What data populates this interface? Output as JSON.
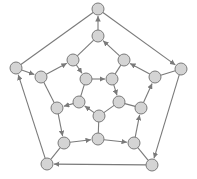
{
  "diagram": {
    "type": "directed-graph",
    "style": {
      "node_fill": "#d4d4d4",
      "node_stroke": "#7a7a7a",
      "edge_color": "#7a7a7a",
      "node_radius": 6
    },
    "nodes": [
      {
        "id": "n0",
        "x": 98,
        "y": 9
      },
      {
        "id": "n1",
        "x": 98,
        "y": 36
      },
      {
        "id": "n2",
        "x": 73,
        "y": 60
      },
      {
        "id": "n3",
        "x": 124,
        "y": 60
      },
      {
        "id": "n4",
        "x": 16,
        "y": 68
      },
      {
        "id": "n5",
        "x": 181,
        "y": 69
      },
      {
        "id": "n6",
        "x": 41,
        "y": 77
      },
      {
        "id": "n7",
        "x": 155,
        "y": 77
      },
      {
        "id": "n8",
        "x": 86,
        "y": 79
      },
      {
        "id": "n9",
        "x": 112,
        "y": 79
      },
      {
        "id": "n10",
        "x": 57,
        "y": 108
      },
      {
        "id": "n11",
        "x": 79,
        "y": 102
      },
      {
        "id": "n12",
        "x": 119,
        "y": 102
      },
      {
        "id": "n13",
        "x": 141,
        "y": 108
      },
      {
        "id": "n14",
        "x": 99,
        "y": 116
      },
      {
        "id": "n15",
        "x": 64,
        "y": 143
      },
      {
        "id": "n16",
        "x": 98,
        "y": 139
      },
      {
        "id": "n17",
        "x": 134,
        "y": 143
      },
      {
        "id": "n18",
        "x": 47,
        "y": 164
      },
      {
        "id": "n19",
        "x": 152,
        "y": 165
      }
    ],
    "edges": [
      {
        "from": "n4",
        "to": "n6",
        "directed": true
      },
      {
        "from": "n6",
        "to": "n2",
        "directed": true
      },
      {
        "from": "n2",
        "to": "n8",
        "directed": true
      },
      {
        "from": "n8",
        "to": "n9",
        "directed": true
      },
      {
        "from": "n9",
        "to": "n12",
        "directed": true
      },
      {
        "from": "n14",
        "to": "n11",
        "directed": true
      },
      {
        "from": "n11",
        "to": "n10",
        "directed": true
      },
      {
        "from": "n10",
        "to": "n15",
        "directed": true
      },
      {
        "from": "n15",
        "to": "n16",
        "directed": true
      },
      {
        "from": "n16",
        "to": "n17",
        "directed": true
      },
      {
        "from": "n17",
        "to": "n13",
        "directed": true
      },
      {
        "from": "n13",
        "to": "n7",
        "directed": true
      },
      {
        "from": "n7",
        "to": "n3",
        "directed": true
      },
      {
        "from": "n3",
        "to": "n1",
        "directed": true
      },
      {
        "from": "n1",
        "to": "n0",
        "directed": true
      },
      {
        "from": "n0",
        "to": "n5",
        "directed": true
      },
      {
        "from": "n5",
        "to": "n19",
        "directed": true
      },
      {
        "from": "n19",
        "to": "n18",
        "directed": true
      },
      {
        "from": "n18",
        "to": "n4",
        "directed": true
      },
      {
        "from": "n12",
        "to": "n14",
        "directed": false
      },
      {
        "from": "n4",
        "to": "n0",
        "directed": false
      },
      {
        "from": "n6",
        "to": "n10",
        "directed": false
      },
      {
        "from": "n2",
        "to": "n1",
        "directed": false
      },
      {
        "from": "n3",
        "to": "n9",
        "directed": false
      },
      {
        "from": "n7",
        "to": "n5",
        "directed": false
      },
      {
        "from": "n13",
        "to": "n12",
        "directed": false
      },
      {
        "from": "n17",
        "to": "n19",
        "directed": false
      },
      {
        "from": "n15",
        "to": "n18",
        "directed": false
      },
      {
        "from": "n16",
        "to": "n14",
        "directed": false
      },
      {
        "from": "n8",
        "to": "n11",
        "directed": false
      }
    ]
  }
}
